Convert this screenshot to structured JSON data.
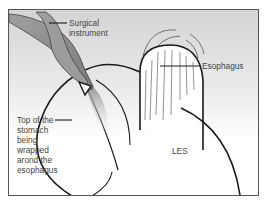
{
  "figure": {
    "labels": {
      "surgical_instrument_line1": "Surgical",
      "surgical_instrument_line2": "instrument",
      "esophagus": "Esophagus",
      "top_line1": "Top of the",
      "top_line2": "stomach",
      "top_line3": "being",
      "top_line4": "wrapped",
      "top_line5": "arond the",
      "top_line6": "esophagus",
      "les": "LES"
    },
    "colors": {
      "background_top": "#d6d6d6",
      "background_bottom": "#ffffff",
      "outline": "#1a1a1a",
      "instrument_dark": "#8a8a8a",
      "instrument_light": "#bdbdbd",
      "frame": "#555555",
      "text": "#444444"
    }
  }
}
